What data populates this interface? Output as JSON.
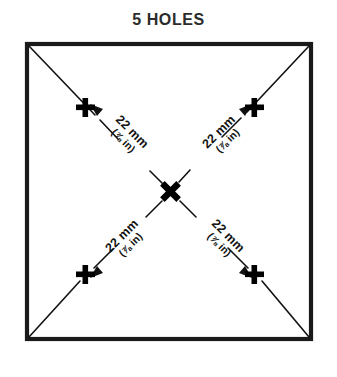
{
  "diagram": {
    "title": "5 HOLES",
    "colors": {
      "background": "#ffffff",
      "stroke": "#111111",
      "border": "#1a1a1a",
      "text": "#2b2b2b"
    },
    "shape": {
      "name": "square-outline",
      "stroke_width": 4
    },
    "diagonals": {
      "name": "corner-to-corner-diagonals",
      "count": 2,
      "stroke_width": 1.6
    },
    "holes": {
      "count": 5,
      "marker_shape": "bold-cross",
      "center_marker_shape": "bold-x",
      "items": [
        {
          "id": "hole-top-left",
          "position": "top-left"
        },
        {
          "id": "hole-top-right",
          "position": "top-right"
        },
        {
          "id": "hole-center",
          "position": "center"
        },
        {
          "id": "hole-bottom-left",
          "position": "bottom-left"
        },
        {
          "id": "hole-bottom-right",
          "position": "bottom-right"
        }
      ]
    },
    "dimensions": [
      {
        "id": "dim-top-left",
        "metric": "22 mm",
        "imperial": "(⅞ in)",
        "from": "hole-center",
        "to": "hole-top-left"
      },
      {
        "id": "dim-top-right",
        "metric": "22 mm",
        "imperial": "(⅞ in)",
        "from": "hole-center",
        "to": "hole-top-right"
      },
      {
        "id": "dim-bottom-left",
        "metric": "22 mm",
        "imperial": "(⅞ in)",
        "from": "hole-center",
        "to": "hole-bottom-left"
      },
      {
        "id": "dim-bottom-right",
        "metric": "22 mm",
        "imperial": "(⅞ in)",
        "from": "hole-center",
        "to": "hole-bottom-right"
      }
    ]
  }
}
